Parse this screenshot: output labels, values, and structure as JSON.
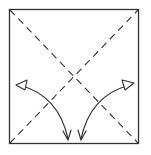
{
  "diagram": {
    "type": "origami-fold-diagram",
    "description": "Square paper with two dashed diagonal valley folds; curved arrows indicate folding the left and right corners down to the bottom edge center",
    "colors": {
      "background": "#ffffff",
      "line": "#333333",
      "arrow_head_fill": "#ffffff"
    },
    "square": {
      "x": 9,
      "y": 9,
      "width": 130,
      "height": 135
    },
    "fold_lines": [
      {
        "name": "diagonal-top-left-to-bottom-right",
        "style": "dashed"
      },
      {
        "name": "diagonal-bottom-left-to-top-right",
        "style": "dashed"
      }
    ],
    "arrows": [
      {
        "name": "left-fold-arrow",
        "from": "left-side",
        "to": "bottom-center",
        "bidirectional": true
      },
      {
        "name": "right-fold-arrow",
        "from": "right-side",
        "to": "bottom-center",
        "bidirectional": true
      }
    ]
  }
}
